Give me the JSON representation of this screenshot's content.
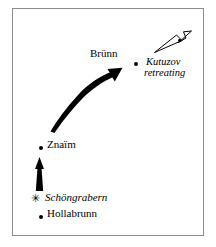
{
  "figure": {
    "name": "schongrabern-campaign-map",
    "background_color": "#ffffff",
    "border_color": "#8c8c8c"
  },
  "places": [
    {
      "id": "brunn",
      "label": "Brünn",
      "style": "roman",
      "marker": "dot",
      "label_x": 90,
      "label_y": 52,
      "dot_x": 134,
      "dot_y": 62
    },
    {
      "id": "znaim",
      "label": "Znaïm",
      "style": "roman",
      "marker": "dot",
      "label_x": 47,
      "label_y": 141,
      "dot_x": 39,
      "dot_y": 146
    },
    {
      "id": "schongrabern",
      "label": "Schöngrabern",
      "style": "italic",
      "marker": "star",
      "label_x": 46,
      "label_y": 196,
      "dot_x": 34,
      "dot_y": 196
    },
    {
      "id": "hollabrunn",
      "label": "Hollabrunn",
      "style": "roman",
      "marker": "dot",
      "label_x": 47,
      "label_y": 210,
      "dot_x": 39,
      "dot_y": 215
    }
  ],
  "annotations": [
    {
      "id": "kutuzov-retreating",
      "line1": "Kutuzov",
      "line2": "retreating",
      "x": 146,
      "y": 60
    }
  ],
  "arrows": [
    {
      "id": "curved-advance-arrow",
      "style": "solid-black-curved",
      "from": "Znaïm",
      "to": "Brünn"
    },
    {
      "id": "vertical-advance-arrow",
      "style": "solid-black-straight",
      "from": "Schöngrabern",
      "to": "Znaïm"
    },
    {
      "id": "kutuzov-retreat-arrow",
      "style": "hollow-outline",
      "direction": "northeast"
    }
  ],
  "colors": {
    "ink": "#000000",
    "frame": "#8c8c8c",
    "paper": "#ffffff"
  }
}
